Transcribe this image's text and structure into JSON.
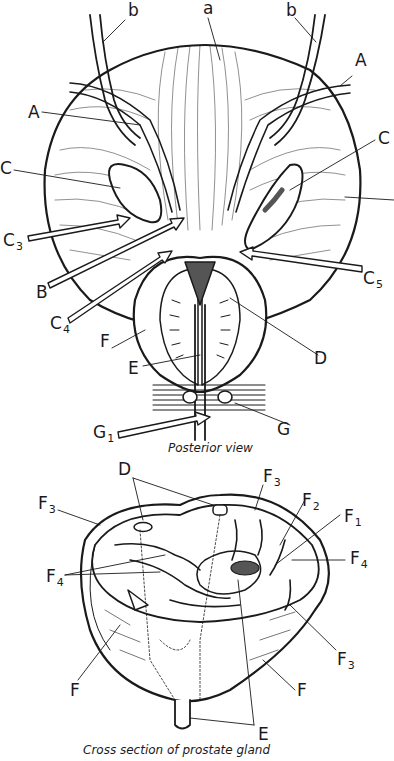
{
  "figure": {
    "posterior_view": {
      "caption": "Posterior view",
      "labels": {
        "a": "a",
        "b_left": "b",
        "b_right": "b",
        "A_left": "A",
        "A_right": "A",
        "C_left": "C",
        "C_right": "C",
        "C3": {
          "base": "C",
          "sub": "3"
        },
        "B": "B",
        "C4": {
          "base": "C",
          "sub": "4"
        },
        "C5": {
          "base": "C",
          "sub": "5"
        },
        "F": "F",
        "D": "D",
        "E": "E",
        "G": "G",
        "G1": {
          "base": "G",
          "sub": "1"
        }
      }
    },
    "cross_section": {
      "caption": "Cross section of prostate gland",
      "labels": {
        "D": "D",
        "F3_top": {
          "base": "F",
          "sub": "3"
        },
        "F3_left": {
          "base": "F",
          "sub": "3"
        },
        "F2": {
          "base": "F",
          "sub": "2"
        },
        "F1": {
          "base": "F",
          "sub": "1"
        },
        "F4_right": {
          "base": "F",
          "sub": "4"
        },
        "F4_left": {
          "base": "F",
          "sub": "4"
        },
        "F3_right": {
          "base": "F",
          "sub": "3"
        },
        "F_left": "F",
        "F_right": "F",
        "E": "E"
      }
    },
    "colors": {
      "line": "#1a1a1a",
      "fill_dark": "#555555",
      "background": "#ffffff"
    }
  }
}
